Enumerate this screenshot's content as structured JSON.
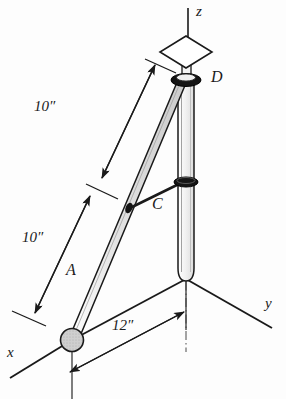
{
  "figure": {
    "type": "engineering-statics-diagram",
    "background_color": "#fdfdfd",
    "line_color": "#1a1a1a",
    "rod_fill_color": "#d8d8d8",
    "joint_fill_color": "#c8c8c8"
  },
  "axes": [
    {
      "name": "z-axis",
      "label": "z",
      "direction": "up"
    },
    {
      "name": "y-axis",
      "label": "y",
      "direction": "down-right"
    },
    {
      "name": "x-axis",
      "label": "x",
      "direction": "down-left"
    }
  ],
  "points": [
    {
      "name": "point-D",
      "label": "D",
      "description": "bearing collar at top of vertical shaft"
    },
    {
      "name": "point-C",
      "label": "C",
      "description": "link connection collar on shaft"
    },
    {
      "name": "point-A",
      "label": "A",
      "description": "ball and socket joint at origin"
    }
  ],
  "dimensions": [
    {
      "name": "dimension-upper",
      "label": "10″",
      "segment": "C to D"
    },
    {
      "name": "dimension-lower",
      "label": "10″",
      "segment": "A to C"
    },
    {
      "name": "dimension-base",
      "label": "12″",
      "segment": "horizontal offset from A to shaft"
    }
  ],
  "components": [
    {
      "name": "vertical-shaft",
      "description": "tubular shaft along z axis with centerline"
    },
    {
      "name": "diagonal-rod",
      "description": "shaded rod from A up to D"
    },
    {
      "name": "link-member",
      "description": "short link from rod at C to shaft collar"
    },
    {
      "name": "thrust-bearing-symbol",
      "description": "rhombus bearing symbol on z axis above D"
    }
  ]
}
